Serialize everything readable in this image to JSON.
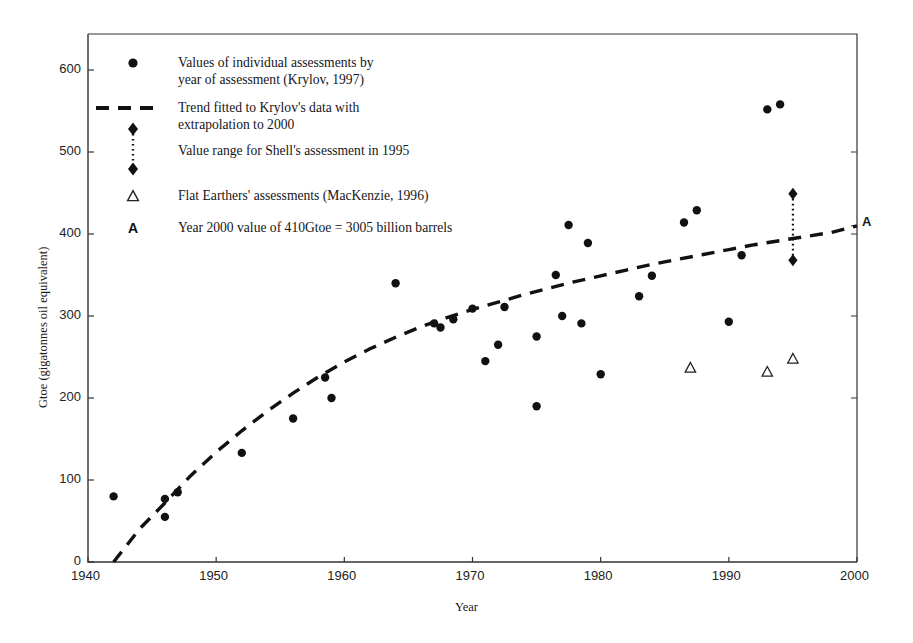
{
  "figure": {
    "axis_x_title": "Year",
    "axis_y_title": "Gtoe (gigatonnes oil equivalent)",
    "right_axis_marker": "A"
  },
  "legend": {
    "entries": [
      {
        "marker": "filled-circle",
        "line1": "Values of individual assessments by",
        "line2": "year of assessment (Krylov, 1997)"
      },
      {
        "marker": "dashed-line",
        "line1": "Trend fitted to Krylov's data with",
        "line2": "extrapolation to 2000"
      },
      {
        "marker": "diamond-range",
        "line1": "Value range for Shell's assessment in 1995",
        "line2": ""
      },
      {
        "marker": "open-triangle",
        "line1": "Flat Earthers' assessments (MacKenzie, 1996)",
        "line2": ""
      },
      {
        "marker": "letter-A",
        "line1": "Year 2000 value of 410Gtoe = 3005 billion barrels",
        "line2": ""
      }
    ]
  },
  "chart_data": {
    "type": "scatter",
    "title": "",
    "xlabel": "Year",
    "ylabel": "Gtoe (gigatonnes oil equivalent)",
    "xlim": [
      1940,
      2000
    ],
    "ylim": [
      0,
      630
    ],
    "xticks": [
      1940,
      1950,
      1960,
      1970,
      1980,
      1990,
      2000
    ],
    "xtick_labels": [
      "1940",
      "1950",
      "1960",
      "1970",
      "1980",
      "1990",
      "2000"
    ],
    "yticks": [
      0,
      100,
      200,
      300,
      400,
      500,
      600
    ],
    "ytick_labels": [
      "0",
      "100",
      "200",
      "300",
      "400",
      "500",
      "600"
    ],
    "grid": false,
    "legend_position": "upper-left-inside",
    "series": [
      {
        "name": "Values of individual assessments by year of assessment (Krylov, 1997)",
        "marker": "filled-circle",
        "points": [
          [
            1942,
            80
          ],
          [
            1946,
            77
          ],
          [
            1946,
            55
          ],
          [
            1947,
            85
          ],
          [
            1952,
            133
          ],
          [
            1956,
            175
          ],
          [
            1958.5,
            225
          ],
          [
            1959,
            200
          ],
          [
            1964,
            340
          ],
          [
            1967,
            291
          ],
          [
            1967.5,
            286
          ],
          [
            1968.5,
            296
          ],
          [
            1970,
            309
          ],
          [
            1971,
            245
          ],
          [
            1972,
            265
          ],
          [
            1972.5,
            311
          ],
          [
            1975,
            275
          ],
          [
            1975,
            190
          ],
          [
            1976.5,
            350
          ],
          [
            1977,
            300
          ],
          [
            1977.5,
            411
          ],
          [
            1978.5,
            291
          ],
          [
            1979,
            389
          ],
          [
            1980,
            229
          ],
          [
            1983,
            324
          ],
          [
            1984,
            349
          ],
          [
            1986.5,
            414
          ],
          [
            1987.5,
            429
          ],
          [
            1990,
            293
          ],
          [
            1991,
            374
          ],
          [
            1993,
            552
          ],
          [
            1994,
            558
          ]
        ]
      },
      {
        "name": "Flat Earthers' assessments (MacKenzie, 1996)",
        "marker": "open-triangle",
        "points": [
          [
            1987,
            237
          ],
          [
            1993,
            232
          ],
          [
            1995,
            248
          ]
        ]
      },
      {
        "name": "Value range for Shell's assessment in 1995",
        "marker": "diamond-range",
        "x": 1995,
        "low": 368,
        "high": 449
      },
      {
        "name": "Trend fitted to Krylov's data with extrapolation to 2000",
        "marker": "dashed-line",
        "points": [
          [
            1942,
            0
          ],
          [
            1944,
            40
          ],
          [
            1946,
            72
          ],
          [
            1948,
            105
          ],
          [
            1950,
            134
          ],
          [
            1952,
            160
          ],
          [
            1954,
            184
          ],
          [
            1956,
            206
          ],
          [
            1958,
            226
          ],
          [
            1960,
            244
          ],
          [
            1962,
            260
          ],
          [
            1964,
            274
          ],
          [
            1966,
            287
          ],
          [
            1968,
            298
          ],
          [
            1970,
            308
          ],
          [
            1972,
            317
          ],
          [
            1974,
            326
          ],
          [
            1976,
            334
          ],
          [
            1978,
            342
          ],
          [
            1980,
            349
          ],
          [
            1982,
            356
          ],
          [
            1984,
            363
          ],
          [
            1986,
            369
          ],
          [
            1988,
            375
          ],
          [
            1990,
            381
          ],
          [
            1992,
            387
          ],
          [
            1994,
            392
          ],
          [
            1996,
            397
          ],
          [
            1998,
            402
          ],
          [
            2000,
            410
          ]
        ]
      }
    ],
    "annotations": [
      {
        "text": "A",
        "x": 2000.5,
        "y": 410,
        "note": "Year 2000 value of 410Gtoe = 3005 billion barrels"
      }
    ]
  }
}
